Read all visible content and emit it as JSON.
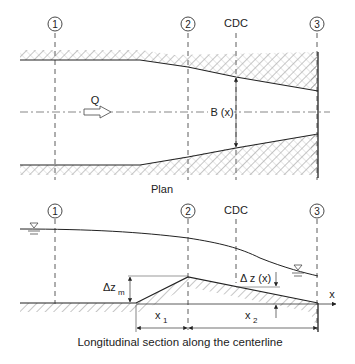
{
  "plan": {
    "title": "Plan",
    "sections": [
      {
        "id": "1",
        "label": "1"
      },
      {
        "id": "2",
        "label": "2"
      },
      {
        "id": "3",
        "label": "3"
      }
    ],
    "cdc_label": "CDC",
    "flow_label": "Q",
    "width_label": "B (x)"
  },
  "section": {
    "title": "Longitudinal section along the centerline",
    "sections": [
      {
        "id": "1",
        "label": "1"
      },
      {
        "id": "2",
        "label": "2"
      },
      {
        "id": "3",
        "label": "3"
      }
    ],
    "cdc_label": "CDC",
    "dz_m_label": "Δz",
    "dz_m_sub": "m",
    "dz_x_label": "Δ z (x)",
    "x1_label": "x",
    "x1_sub": "1",
    "x2_label": "x",
    "x2_sub": "2",
    "axis_label": "x"
  }
}
